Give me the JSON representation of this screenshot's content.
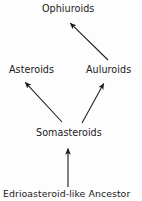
{
  "diagram": {
    "type": "phylogenetic-tree",
    "background_color": "#fdfdfd",
    "line_color": "#1a1a1a",
    "text_color": "#1a1a1a",
    "nodes": [
      {
        "id": "ophiuroids",
        "label": "Ophiuroids",
        "x": 71,
        "y": 9
      },
      {
        "id": "asteroids",
        "label": "Asteroids",
        "x": 34,
        "y": 70
      },
      {
        "id": "auluroids",
        "label": "Auluroids",
        "x": 111,
        "y": 70
      },
      {
        "id": "somasteroids",
        "label": "Somasteroids",
        "x": 68,
        "y": 133
      },
      {
        "id": "ancestor",
        "label": "Edrioasteroid-like Ancestor",
        "x": 71,
        "y": 194
      }
    ],
    "arrows": [
      {
        "id": "ancestor-to-somasteroids",
        "from": "ancestor",
        "to": "somasteroids",
        "x1": 68,
        "y1": 187,
        "x2": 68,
        "y2": 147
      },
      {
        "id": "somasteroids-to-asteroids",
        "from": "somasteroids",
        "to": "asteroids",
        "x1": 62,
        "y1": 122,
        "x2": 24,
        "y2": 81
      },
      {
        "id": "somasteroids-to-auluroids",
        "from": "somasteroids",
        "to": "auluroids",
        "x1": 82,
        "y1": 123,
        "x2": 105,
        "y2": 82
      },
      {
        "id": "auluroids-to-ophiuroids",
        "from": "auluroids",
        "to": "ophiuroids",
        "x1": 108,
        "y1": 60,
        "x2": 69,
        "y2": 22
      }
    ]
  }
}
